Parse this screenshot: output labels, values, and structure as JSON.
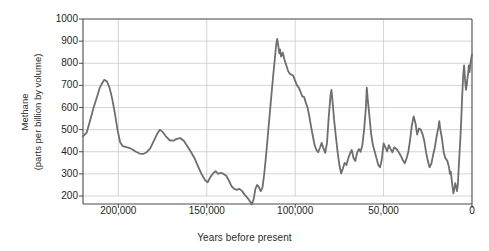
{
  "chart_data": {
    "type": "line",
    "title": "",
    "xlabel": "Years before present",
    "ylabel_line1": "Methane",
    "ylabel_line2": "(parts per billion by volume)",
    "xlim": [
      220000,
      0
    ],
    "ylim": [
      150,
      1000
    ],
    "x_reversed": true,
    "grid": true,
    "legend": "none",
    "line_color": "#6e6e6e",
    "line_width": 1.8,
    "x_ticks": [
      200000,
      150000,
      100000,
      50000,
      0
    ],
    "x_tick_labels": [
      "200,000",
      "150,000",
      "100,000",
      "50,000",
      "0"
    ],
    "y_ticks": [
      200,
      300,
      400,
      500,
      600,
      700,
      800,
      900,
      1000
    ],
    "y_tick_labels": [
      "200",
      "300",
      "400",
      "500",
      "600",
      "700",
      "800",
      "900",
      "1000"
    ],
    "series": [
      {
        "name": "Methane",
        "x": [
          220000,
          217500,
          214000,
          211000,
          208000,
          205500,
          203500,
          202000,
          200500,
          198500,
          196500,
          194000,
          191500,
          189000,
          186500,
          184000,
          181500,
          179000,
          176500,
          174000,
          171500,
          169000,
          166500,
          164000,
          161500,
          159000,
          156500,
          154000,
          152000,
          150000,
          148000,
          146500,
          145000,
          143500,
          142000,
          140500,
          139000,
          137500,
          136000,
          134500,
          133000,
          131000,
          129000,
          127000,
          125000,
          123000,
          121000,
          119000,
          117000,
          115000,
          113000,
          111000,
          109000,
          107000,
          105000,
          103000,
          101000,
          99000,
          97000,
          95000,
          93000,
          91000,
          89000,
          87000,
          85000,
          83000,
          81000,
          79000,
          77000,
          75000,
          73000,
          71000,
          69000,
          67000,
          65000,
          63000,
          61000,
          59000,
          57000,
          55000,
          53000,
          51000,
          49000,
          47000,
          45000,
          43000,
          41000,
          39000,
          37000,
          35000,
          33000,
          31000,
          29000,
          27000,
          25000,
          23000,
          21000,
          19000,
          17000,
          15000,
          13000,
          11500,
          10000,
          8500,
          7000,
          5500,
          4000,
          2500,
          1000,
          0
        ],
        "values": [
          470,
          520,
          600,
          660,
          710,
          725,
          690,
          630,
          545,
          470,
          425,
          420,
          415,
          400,
          390,
          392,
          400,
          425,
          465,
          500,
          480,
          455,
          450,
          462,
          445,
          415,
          380,
          330,
          290,
          265,
          300,
          312,
          300,
          305,
          300,
          285,
          262,
          238,
          228,
          232,
          215,
          196,
          175,
          162,
          200,
          250,
          232,
          218,
          280,
          390,
          510,
          640,
          760,
          850,
          910,
          858,
          812,
          850,
          790,
          752,
          740,
          700,
          680,
          655,
          648,
          600,
          545,
          480,
          430,
          400,
          438,
          395,
          440,
          560,
          680,
          565,
          450,
          390,
          340,
          300,
          345,
          385,
          405,
          370,
          395,
          430,
          560,
          690,
          600,
          470,
          430,
          370,
          330,
          385,
          440,
          415,
          400,
          420,
          412,
          430,
          395,
          352,
          350,
          392,
          440,
          500,
          560,
          480,
          510,
          470
        ],
        "values_continued": [],
        "notes": "Ice-core methane record; approximate reading of the plotted curve"
      }
    ],
    "series_points": [
      [
        220000,
        470
      ],
      [
        218000,
        485
      ],
      [
        216000,
        540
      ],
      [
        214000,
        600
      ],
      [
        212000,
        650
      ],
      [
        210500,
        690
      ],
      [
        209000,
        712
      ],
      [
        208000,
        725
      ],
      [
        206500,
        718
      ],
      [
        205000,
        690
      ],
      [
        203500,
        640
      ],
      [
        202000,
        575
      ],
      [
        200500,
        500
      ],
      [
        199000,
        443
      ],
      [
        197500,
        425
      ],
      [
        196000,
        422
      ],
      [
        194000,
        418
      ],
      [
        192000,
        410
      ],
      [
        190000,
        400
      ],
      [
        188000,
        392
      ],
      [
        186000,
        390
      ],
      [
        184000,
        398
      ],
      [
        182000,
        415
      ],
      [
        180000,
        448
      ],
      [
        178000,
        482
      ],
      [
        176500,
        500
      ],
      [
        175000,
        490
      ],
      [
        173000,
        468
      ],
      [
        171000,
        452
      ],
      [
        169000,
        450
      ],
      [
        167000,
        458
      ],
      [
        165000,
        462
      ],
      [
        163000,
        450
      ],
      [
        161000,
        425
      ],
      [
        159000,
        400
      ],
      [
        157000,
        372
      ],
      [
        155000,
        335
      ],
      [
        153000,
        300
      ],
      [
        151000,
        272
      ],
      [
        149500,
        262
      ],
      [
        148000,
        285
      ],
      [
        146500,
        302
      ],
      [
        145000,
        312
      ],
      [
        143500,
        300
      ],
      [
        142000,
        305
      ],
      [
        140500,
        300
      ],
      [
        139000,
        292
      ],
      [
        137500,
        270
      ],
      [
        136000,
        245
      ],
      [
        134500,
        232
      ],
      [
        133000,
        228
      ],
      [
        131500,
        232
      ],
      [
        130000,
        222
      ],
      [
        128500,
        205
      ],
      [
        127000,
        192
      ],
      [
        125500,
        175
      ],
      [
        124500,
        162
      ],
      [
        123500,
        185
      ],
      [
        122500,
        232
      ],
      [
        121500,
        250
      ],
      [
        120500,
        240
      ],
      [
        119500,
        222
      ],
      [
        118500,
        238
      ],
      [
        117500,
        300
      ],
      [
        116500,
        380
      ],
      [
        115500,
        470
      ],
      [
        114500,
        560
      ],
      [
        113500,
        650
      ],
      [
        112500,
        740
      ],
      [
        111500,
        820
      ],
      [
        110800,
        880
      ],
      [
        110200,
        910
      ],
      [
        109500,
        878
      ],
      [
        109000,
        845
      ],
      [
        108500,
        862
      ],
      [
        108000,
        830
      ],
      [
        107000,
        848
      ],
      [
        106000,
        815
      ],
      [
        105000,
        790
      ],
      [
        104000,
        765
      ],
      [
        103000,
        752
      ],
      [
        102000,
        748
      ],
      [
        101000,
        742
      ],
      [
        100000,
        720
      ],
      [
        99000,
        700
      ],
      [
        98000,
        690
      ],
      [
        97000,
        672
      ],
      [
        96000,
        650
      ],
      [
        95000,
        648
      ],
      [
        94000,
        622
      ],
      [
        93000,
        600
      ],
      [
        92000,
        560
      ],
      [
        91000,
        512
      ],
      [
        90000,
        470
      ],
      [
        89000,
        430
      ],
      [
        88000,
        408
      ],
      [
        87000,
        398
      ],
      [
        86000,
        418
      ],
      [
        85000,
        440
      ],
      [
        84000,
        415
      ],
      [
        83000,
        395
      ],
      [
        82000,
        440
      ],
      [
        81000,
        560
      ],
      [
        80000,
        655
      ],
      [
        79500,
        680
      ],
      [
        79000,
        640
      ],
      [
        78000,
        545
      ],
      [
        77000,
        470
      ],
      [
        76000,
        398
      ],
      [
        75000,
        340
      ],
      [
        74000,
        302
      ],
      [
        73000,
        325
      ],
      [
        72000,
        350
      ],
      [
        71000,
        340
      ],
      [
        70000,
        370
      ],
      [
        69000,
        392
      ],
      [
        68000,
        408
      ],
      [
        67000,
        372
      ],
      [
        66000,
        358
      ],
      [
        65000,
        395
      ],
      [
        64000,
        412
      ],
      [
        63000,
        400
      ],
      [
        62000,
        430
      ],
      [
        61000,
        500
      ],
      [
        60000,
        600
      ],
      [
        59500,
        690
      ],
      [
        59000,
        640
      ],
      [
        58000,
        560
      ],
      [
        57000,
        478
      ],
      [
        56000,
        428
      ],
      [
        55000,
        400
      ],
      [
        54000,
        370
      ],
      [
        53000,
        340
      ],
      [
        52000,
        330
      ],
      [
        51000,
        365
      ],
      [
        50000,
        438
      ],
      [
        49000,
        420
      ],
      [
        48000,
        402
      ],
      [
        47000,
        430
      ],
      [
        46000,
        412
      ],
      [
        45000,
        398
      ],
      [
        44000,
        420
      ],
      [
        43000,
        415
      ],
      [
        42000,
        405
      ],
      [
        41000,
        392
      ],
      [
        40000,
        378
      ],
      [
        39000,
        360
      ],
      [
        38000,
        348
      ],
      [
        37000,
        370
      ],
      [
        36000,
        400
      ],
      [
        35000,
        455
      ],
      [
        34000,
        520
      ],
      [
        33000,
        560
      ],
      [
        32000,
        530
      ],
      [
        31000,
        478
      ],
      [
        30000,
        505
      ],
      [
        29000,
        500
      ],
      [
        28000,
        480
      ],
      [
        27000,
        450
      ],
      [
        26000,
        398
      ],
      [
        25000,
        360
      ],
      [
        24000,
        330
      ],
      [
        23000,
        345
      ],
      [
        22000,
        385
      ],
      [
        21000,
        420
      ],
      [
        20000,
        470
      ],
      [
        19000,
        510
      ],
      [
        18500,
        538
      ],
      [
        18000,
        505
      ],
      [
        17000,
        460
      ],
      [
        16000,
        398
      ],
      [
        15000,
        370
      ],
      [
        14000,
        360
      ],
      [
        13000,
        330
      ],
      [
        12500,
        300
      ],
      [
        12000,
        310
      ],
      [
        11500,
        275
      ],
      [
        11000,
        240
      ],
      [
        10500,
        212
      ],
      [
        10000,
        232
      ],
      [
        9500,
        258
      ],
      [
        9000,
        245
      ],
      [
        8500,
        222
      ],
      [
        8000,
        250
      ],
      [
        7500,
        330
      ],
      [
        7000,
        400
      ],
      [
        6500,
        470
      ],
      [
        6000,
        560
      ],
      [
        5500,
        660
      ],
      [
        5000,
        740
      ],
      [
        4500,
        790
      ],
      [
        4200,
        760
      ],
      [
        3800,
        712
      ],
      [
        3400,
        680
      ],
      [
        3000,
        700
      ],
      [
        2600,
        730
      ],
      [
        2200,
        752
      ],
      [
        1800,
        790
      ],
      [
        1400,
        760
      ],
      [
        1000,
        790
      ],
      [
        600,
        812
      ],
      [
        200,
        832
      ],
      [
        0,
        840
      ]
    ]
  }
}
